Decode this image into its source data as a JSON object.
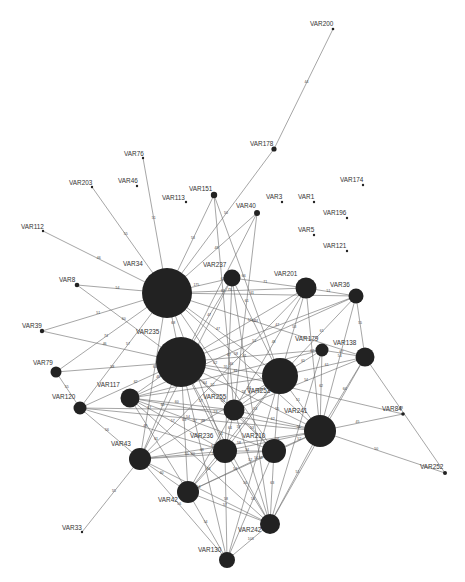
{
  "diagram": {
    "type": "network-graph",
    "node_color": "#222222",
    "edge_color": "#6a6a6a",
    "background": "#ffffff",
    "nodes": [
      {
        "id": "VAR200",
        "label": "VAR200",
        "x": 333,
        "y": 29,
        "r": 1.3,
        "lx": 310,
        "ly": 26
      },
      {
        "id": "VAR178",
        "label": "VAR178",
        "x": 274,
        "y": 149,
        "r": 2.6,
        "lx": 250,
        "ly": 146
      },
      {
        "id": "VAR76",
        "label": "VAR76",
        "x": 143,
        "y": 158,
        "r": 1.2,
        "lx": 124,
        "ly": 156
      },
      {
        "id": "VAR203",
        "label": "VAR203",
        "x": 92,
        "y": 187,
        "r": 1.2,
        "lx": 69,
        "ly": 185
      },
      {
        "id": "VAR46",
        "label": "VAR46",
        "x": 137,
        "y": 186,
        "r": 1.2,
        "lx": 118,
        "ly": 183
      },
      {
        "id": "VAR174",
        "label": "VAR174",
        "x": 363,
        "y": 185,
        "r": 1.2,
        "lx": 340,
        "ly": 182
      },
      {
        "id": "VAR151",
        "label": "VAR151",
        "x": 214,
        "y": 195,
        "r": 3.2,
        "lx": 189,
        "ly": 191
      },
      {
        "id": "VAR113",
        "label": "VAR113",
        "x": 186,
        "y": 202,
        "r": 1.2,
        "lx": 162,
        "ly": 200
      },
      {
        "id": "VAR3",
        "label": "VAR3",
        "x": 282,
        "y": 202,
        "r": 1.2,
        "lx": 266,
        "ly": 199
      },
      {
        "id": "VAR1",
        "label": "VAR1",
        "x": 314,
        "y": 202,
        "r": 1.2,
        "lx": 298,
        "ly": 199
      },
      {
        "id": "VAR40",
        "label": "VAR40",
        "x": 257,
        "y": 213,
        "r": 3.0,
        "lx": 236,
        "ly": 208
      },
      {
        "id": "VAR196",
        "label": "VAR196",
        "x": 347,
        "y": 218,
        "r": 1.2,
        "lx": 323,
        "ly": 215
      },
      {
        "id": "VAR112",
        "label": "VAR112",
        "x": 43,
        "y": 231,
        "r": 1.2,
        "lx": 21,
        "ly": 229
      },
      {
        "id": "VAR5",
        "label": "VAR5",
        "x": 314,
        "y": 235,
        "r": 1.2,
        "lx": 298,
        "ly": 232
      },
      {
        "id": "VAR121",
        "label": "VAR121",
        "x": 347,
        "y": 251,
        "r": 1.2,
        "lx": 323,
        "ly": 248
      },
      {
        "id": "VAR34",
        "label": "VAR34",
        "x": 167,
        "y": 293,
        "r": 25,
        "lx": 123,
        "ly": 266
      },
      {
        "id": "VAR237",
        "label": "VAR237",
        "x": 232,
        "y": 278,
        "r": 8.5,
        "lx": 203,
        "ly": 267
      },
      {
        "id": "VAR201",
        "label": "VAR201",
        "x": 306,
        "y": 288,
        "r": 10.5,
        "lx": 274,
        "ly": 276
      },
      {
        "id": "VAR36",
        "label": "VAR36",
        "x": 356,
        "y": 296,
        "r": 7.5,
        "lx": 330,
        "ly": 287
      },
      {
        "id": "VAR8",
        "label": "VAR8",
        "x": 77,
        "y": 285,
        "r": 2.3,
        "lx": 59,
        "ly": 282
      },
      {
        "id": "VAR39",
        "label": "VAR39",
        "x": 42,
        "y": 331,
        "r": 2.2,
        "lx": 22,
        "ly": 328
      },
      {
        "id": "VAR235",
        "label": "VAR235",
        "x": 181,
        "y": 362,
        "r": 25,
        "lx": 136,
        "ly": 334
      },
      {
        "id": "VAR179",
        "label": "VAR179",
        "x": 322,
        "y": 350,
        "r": 6.5,
        "lx": 295,
        "ly": 341
      },
      {
        "id": "VAR138",
        "label": "VAR138",
        "x": 365,
        "y": 357,
        "r": 9.5,
        "lx": 333,
        "ly": 345
      },
      {
        "id": "VAR79",
        "label": "VAR79",
        "x": 56,
        "y": 372,
        "r": 5.5,
        "lx": 33,
        "ly": 365
      },
      {
        "id": "VAR253",
        "label": "VAR253",
        "x": 280,
        "y": 376,
        "r": 18,
        "lx": 247,
        "ly": 393
      },
      {
        "id": "VAR117",
        "label": "VAR117",
        "x": 130,
        "y": 398,
        "r": 9.5,
        "lx": 97,
        "ly": 387
      },
      {
        "id": "VAR120",
        "label": "VAR120",
        "x": 80,
        "y": 408,
        "r": 6.5,
        "lx": 52,
        "ly": 399
      },
      {
        "id": "VAR255",
        "label": "VAR255",
        "x": 234,
        "y": 410,
        "r": 10.5,
        "lx": 203,
        "ly": 399
      },
      {
        "id": "VAR84",
        "label": "VAR84",
        "x": 403,
        "y": 414,
        "r": 1.8,
        "lx": 382,
        "ly": 411
      },
      {
        "id": "VAR241",
        "label": "VAR241",
        "x": 320,
        "y": 431,
        "r": 16,
        "lx": 284,
        "ly": 413
      },
      {
        "id": "VAR236",
        "label": "VAR236",
        "x": 225,
        "y": 451,
        "r": 12,
        "lx": 190,
        "ly": 438
      },
      {
        "id": "VAR210",
        "label": "VAR210",
        "x": 274,
        "y": 451,
        "r": 12,
        "lx": 242,
        "ly": 438
      },
      {
        "id": "VAR43",
        "label": "VAR43",
        "x": 140,
        "y": 459,
        "r": 11,
        "lx": 111,
        "ly": 446
      },
      {
        "id": "VAR252",
        "label": "VAR252",
        "x": 445,
        "y": 473,
        "r": 2.0,
        "lx": 420,
        "ly": 469
      },
      {
        "id": "VAR42",
        "label": "VAR42",
        "x": 188,
        "y": 492,
        "r": 11,
        "lx": 158,
        "ly": 502
      },
      {
        "id": "VAR242",
        "label": "VAR242",
        "x": 270,
        "y": 524,
        "r": 10,
        "lx": 238,
        "ly": 532
      },
      {
        "id": "VAR33",
        "label": "VAR33",
        "x": 82,
        "y": 532,
        "r": 1.2,
        "lx": 62,
        "ly": 530
      },
      {
        "id": "VAR130",
        "label": "VAR130",
        "x": 227,
        "y": 560,
        "r": 8,
        "lx": 198,
        "ly": 552
      }
    ],
    "edges": [
      [
        "VAR200",
        "VAR178",
        "44"
      ],
      [
        "VAR178",
        "VAR34",
        "50"
      ],
      [
        "VAR76",
        "VAR34",
        "51"
      ],
      [
        "VAR203",
        "VAR34",
        "55"
      ],
      [
        "VAR112",
        "VAR34",
        "46"
      ],
      [
        "VAR8",
        "VAR34",
        "54"
      ],
      [
        "VAR8",
        "VAR235",
        "60"
      ],
      [
        "VAR39",
        "VAR34",
        "51"
      ],
      [
        "VAR39",
        "VAR235",
        "46"
      ],
      [
        "VAR79",
        "VAR34",
        "74"
      ],
      [
        "VAR79",
        "VAR235",
        "58"
      ],
      [
        "VAR79",
        "VAR120",
        "55"
      ],
      [
        "VAR151",
        "VAR34",
        "53"
      ],
      [
        "VAR151",
        "VAR255",
        "61"
      ],
      [
        "VAR151",
        "VAR253",
        "66"
      ],
      [
        "VAR40",
        "VAR34",
        "48"
      ],
      [
        "VAR40",
        "VAR235",
        "61"
      ],
      [
        "VAR40",
        "VAR255",
        "61"
      ],
      [
        "VAR34",
        "VAR237",
        "175"
      ],
      [
        "VAR34",
        "VAR201",
        "73"
      ],
      [
        "VAR34",
        "VAR36",
        "61"
      ],
      [
        "VAR34",
        "VAR235",
        "68"
      ],
      [
        "VAR34",
        "VAR253",
        "47"
      ],
      [
        "VAR34",
        "VAR241",
        "58"
      ],
      [
        "VAR34",
        "VAR138",
        "44"
      ],
      [
        "VAR34",
        "VAR120",
        "57"
      ],
      [
        "VAR34",
        "VAR43",
        "60"
      ],
      [
        "VAR34",
        "VAR236",
        "57"
      ],
      [
        "VAR34",
        "VAR210",
        "62"
      ],
      [
        "VAR237",
        "VAR201",
        "71"
      ],
      [
        "VAR237",
        "VAR235",
        "47"
      ],
      [
        "VAR237",
        "VAR253",
        "61"
      ],
      [
        "VAR237",
        "VAR236",
        "67"
      ],
      [
        "VAR237",
        "VAR242",
        "54"
      ],
      [
        "VAR237",
        "VAR43",
        "50"
      ],
      [
        "VAR201",
        "VAR36",
        "51"
      ],
      [
        "VAR201",
        "VAR235",
        "51"
      ],
      [
        "VAR201",
        "VAR253",
        "53"
      ],
      [
        "VAR201",
        "VAR241",
        "62"
      ],
      [
        "VAR201",
        "VAR255",
        "48"
      ],
      [
        "VAR201",
        "VAR43",
        "46"
      ],
      [
        "VAR36",
        "VAR138",
        "55"
      ],
      [
        "VAR36",
        "VAR241",
        "54"
      ],
      [
        "VAR36",
        "VAR253",
        "61"
      ],
      [
        "VAR36",
        "VAR235",
        "47"
      ],
      [
        "VAR36",
        "VAR117",
        "51"
      ],
      [
        "VAR235",
        "VAR179",
        "61"
      ],
      [
        "VAR235",
        "VAR253",
        "55"
      ],
      [
        "VAR235",
        "VAR241",
        "53"
      ],
      [
        "VAR235",
        "VAR255",
        "64"
      ],
      [
        "VAR235",
        "VAR236",
        "57"
      ],
      [
        "VAR235",
        "VAR210",
        "53"
      ],
      [
        "VAR235",
        "VAR43",
        "60"
      ],
      [
        "VAR235",
        "VAR42",
        "63"
      ],
      [
        "VAR235",
        "VAR242",
        "51"
      ],
      [
        "VAR235",
        "VAR130",
        "48"
      ],
      [
        "VAR235",
        "VAR117",
        "48"
      ],
      [
        "VAR235",
        "VAR120",
        "62"
      ],
      [
        "VAR235",
        "VAR84",
        "48"
      ],
      [
        "VAR179",
        "VAR253",
        "61"
      ],
      [
        "VAR179",
        "VAR138",
        "67"
      ],
      [
        "VAR179",
        "VAR241",
        "62"
      ],
      [
        "VAR179",
        "VAR117",
        "61"
      ],
      [
        "VAR179",
        "VAR242",
        "56"
      ],
      [
        "VAR138",
        "VAR253",
        "61"
      ],
      [
        "VAR138",
        "VAR241",
        "60"
      ],
      [
        "VAR138",
        "VAR252",
        "48"
      ],
      [
        "VAR138",
        "VAR242",
        "55"
      ],
      [
        "VAR138",
        "VAR255",
        "54"
      ],
      [
        "VAR253",
        "VAR241",
        "51"
      ],
      [
        "VAR253",
        "VAR255",
        "59"
      ],
      [
        "VAR253",
        "VAR210",
        "55"
      ],
      [
        "VAR253",
        "VAR236",
        "53"
      ],
      [
        "VAR253",
        "VAR42",
        "57"
      ],
      [
        "VAR253",
        "VAR117",
        "52"
      ],
      [
        "VAR253",
        "VAR130",
        "54"
      ],
      [
        "VAR117",
        "VAR255",
        "60"
      ],
      [
        "VAR117",
        "VAR241",
        "53"
      ],
      [
        "VAR117",
        "VAR236",
        "57"
      ],
      [
        "VAR117",
        "VAR210",
        "57"
      ],
      [
        "VAR117",
        "VAR42",
        "61"
      ],
      [
        "VAR117",
        "VAR242",
        "60"
      ],
      [
        "VAR120",
        "VAR255",
        "57"
      ],
      [
        "VAR120",
        "VAR241",
        "54"
      ],
      [
        "VAR120",
        "VAR236",
        "49"
      ],
      [
        "VAR120",
        "VAR43",
        "56"
      ],
      [
        "VAR255",
        "VAR241",
        "62"
      ],
      [
        "VAR255",
        "VAR236",
        "64"
      ],
      [
        "VAR255",
        "VAR210",
        "53"
      ],
      [
        "VAR255",
        "VAR42",
        "67"
      ],
      [
        "VAR255",
        "VAR242",
        "52"
      ],
      [
        "VAR241",
        "VAR84",
        "45"
      ],
      [
        "VAR241",
        "VAR252",
        "50"
      ],
      [
        "VAR241",
        "VAR210",
        "52"
      ],
      [
        "VAR241",
        "VAR236",
        "56"
      ],
      [
        "VAR241",
        "VAR42",
        "53"
      ],
      [
        "VAR241",
        "VAR242",
        "51"
      ],
      [
        "VAR241",
        "VAR43",
        "58"
      ],
      [
        "VAR236",
        "VAR210",
        "54"
      ],
      [
        "VAR236",
        "VAR43",
        "55"
      ],
      [
        "VAR236",
        "VAR42",
        "63"
      ],
      [
        "VAR236",
        "VAR242",
        "56"
      ],
      [
        "VAR236",
        "VAR130",
        "58"
      ],
      [
        "VAR210",
        "VAR42",
        "54"
      ],
      [
        "VAR210",
        "VAR242",
        "63"
      ],
      [
        "VAR210",
        "VAR130",
        "54"
      ],
      [
        "VAR210",
        "VAR43",
        "55"
      ],
      [
        "VAR43",
        "VAR42",
        "60"
      ],
      [
        "VAR43",
        "VAR33",
        "55"
      ],
      [
        "VAR43",
        "VAR242",
        "54"
      ],
      [
        "VAR43",
        "VAR130",
        "56"
      ],
      [
        "VAR42",
        "VAR130",
        "54"
      ],
      [
        "VAR42",
        "VAR242",
        "57"
      ],
      [
        "VAR242",
        "VAR130",
        "103"
      ],
      [
        "VAR43",
        "VAR253",
        "48"
      ]
    ]
  }
}
